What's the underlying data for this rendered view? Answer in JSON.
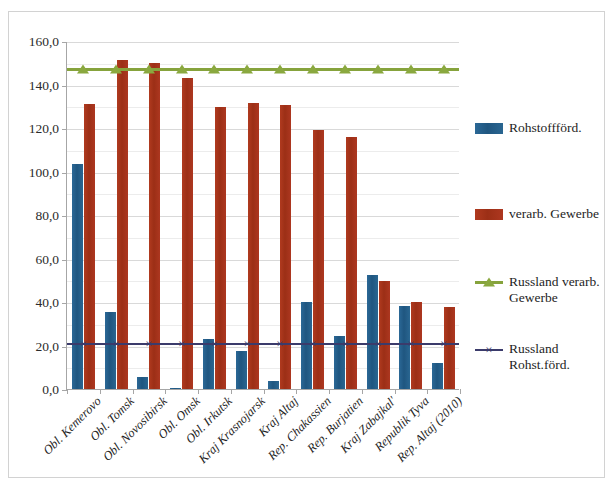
{
  "chart_data": {
    "type": "bar",
    "title": "",
    "xlabel": "",
    "ylabel": "",
    "ylim": [
      0,
      160
    ],
    "ytick_step": 20,
    "ytick_labels": [
      "0,0",
      "20,0",
      "40,0",
      "60,0",
      "80,0",
      "100,0",
      "120,0",
      "140,0",
      "160,0"
    ],
    "grid": true,
    "legend_position": "right",
    "categories": [
      "Obl. Kemerovo",
      "Obl. Tomsk",
      "Obl. Novosibirsk",
      "Obl. Omsk",
      "Obl. Irkutsk",
      "Kraj Krasnojarsk",
      "Kraj Altaj",
      "Rep. Chakassien",
      "Rep. Burjatien",
      "Kraj Zabajkal'",
      "Republik Tyva",
      "Rep. Altaj (2010)"
    ],
    "series": [
      {
        "name": "Rohstoffförd.",
        "type": "bar",
        "color": "#1f5680",
        "values": [
          103.5,
          35.5,
          5.5,
          0.4,
          23.0,
          17.5,
          3.5,
          40.0,
          24.5,
          52.5,
          38.0,
          12.0
        ]
      },
      {
        "name": "verarb. Gewerbe",
        "type": "bar",
        "color": "#ad3720",
        "values": [
          131.0,
          151.5,
          150.0,
          143.0,
          129.5,
          131.5,
          130.5,
          119.0,
          116.0,
          49.5,
          40.0,
          37.5
        ]
      },
      {
        "name": "Russland verarb. Gewerbe",
        "type": "line",
        "color": "#86a33c",
        "marker": "triangle",
        "constant_value": 148.0,
        "values": [
          148.0,
          148.0,
          148.0,
          148.0,
          148.0,
          148.0,
          148.0,
          148.0,
          148.0,
          148.0,
          148.0,
          148.0
        ]
      },
      {
        "name": "Russland Rohst.förd.",
        "type": "line",
        "color": "#3b3b6b",
        "marker": "x",
        "constant_value": 21.8,
        "values": [
          21.8,
          21.8,
          21.8,
          21.8,
          21.8,
          21.8,
          21.8,
          21.8,
          21.8,
          21.8,
          21.8,
          21.8
        ]
      }
    ]
  },
  "legend": {
    "entries": [
      {
        "label": "Rohstoffförd.",
        "marker": "swatch-blue"
      },
      {
        "label": "verarb. Gewerbe",
        "marker": "swatch-red"
      },
      {
        "label": "Russland verarb. Gewerbe",
        "marker": "line-green-triangle"
      },
      {
        "label": "Russland Rohst.förd.",
        "marker": "line-purple-x"
      }
    ]
  },
  "colors": {
    "series_blue": "#1f5680",
    "series_red": "#ad3720",
    "series_green": "#86a33c",
    "series_purple": "#3b3b6b",
    "gridline": "#d9d9d9",
    "axis": "#a6a6a6",
    "frame_border": "#d2d2d2"
  }
}
